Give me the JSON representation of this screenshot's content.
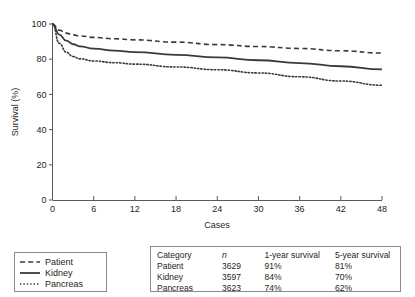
{
  "chart_data": {
    "type": "line",
    "title": "",
    "xlabel": "Cases",
    "ylabel": "Survival (%)",
    "xlim": [
      0,
      48
    ],
    "ylim": [
      0,
      100
    ],
    "xticks": [
      "0",
      "6",
      "12",
      "18",
      "24",
      "30",
      "36",
      "42",
      "48"
    ],
    "yticks": [
      "0",
      "20",
      "40",
      "60",
      "80",
      "100"
    ],
    "grid": false,
    "legend_position": "below-left",
    "series": [
      {
        "name": "Patient",
        "style": "dashed",
        "color": "#3a3a3a",
        "x": [
          0,
          1,
          2,
          3,
          4,
          6,
          9,
          12,
          18,
          24,
          30,
          36,
          42,
          48
        ],
        "values": [
          100,
          96.5,
          94.8,
          93.8,
          93.2,
          92.4,
          91.6,
          91.0,
          89.7,
          88.3,
          87.2,
          86.1,
          84.8,
          83.5
        ]
      },
      {
        "name": "Kidney",
        "style": "solid",
        "color": "#3a3a3a",
        "x": [
          0,
          1,
          2,
          3,
          4,
          6,
          9,
          12,
          18,
          24,
          30,
          36,
          42,
          48
        ],
        "values": [
          100,
          94.0,
          90.5,
          88.5,
          87.3,
          86.0,
          84.9,
          84.0,
          82.5,
          81.0,
          79.4,
          77.8,
          76.0,
          74.2
        ]
      },
      {
        "name": "Pancreas",
        "style": "dotted",
        "color": "#3a3a3a",
        "x": [
          0,
          1,
          2,
          3,
          4,
          6,
          9,
          12,
          18,
          24,
          30,
          36,
          42,
          48
        ],
        "values": [
          100,
          89.0,
          84.0,
          81.5,
          80.2,
          79.0,
          78.0,
          77.2,
          75.6,
          74.0,
          72.2,
          70.0,
          67.6,
          65.2
        ]
      }
    ]
  },
  "legend": {
    "items": [
      {
        "label": "Patient",
        "style": "dashed"
      },
      {
        "label": "Kidney",
        "style": "solid"
      },
      {
        "label": "Pancreas",
        "style": "dotted"
      }
    ]
  },
  "stats_table": {
    "headers": [
      "Category",
      "n",
      "1-year survival",
      "5-year survival"
    ],
    "rows": [
      [
        "Patient",
        "3629",
        "91%",
        "81%"
      ],
      [
        "Kidney",
        "3597",
        "84%",
        "70%"
      ],
      [
        "Pancreas",
        "3623",
        "74%",
        "62%"
      ]
    ]
  }
}
